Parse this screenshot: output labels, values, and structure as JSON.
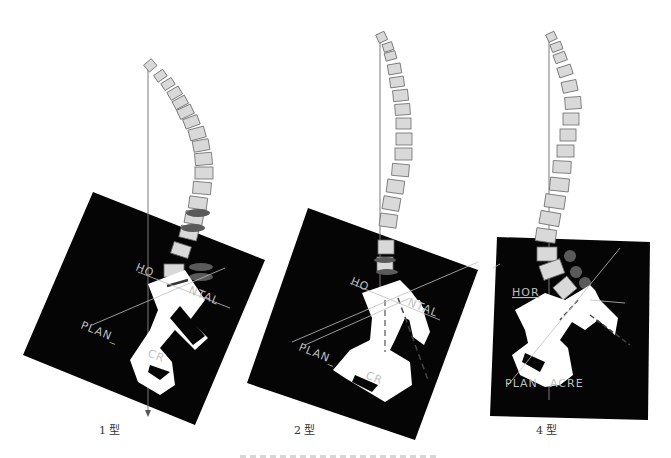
{
  "figure": {
    "panels": [
      {
        "id": "type-1",
        "label": "1 型",
        "horizontal_label": "HORIZONTAL",
        "plan_label": "PLAN_SACRE",
        "horizontal_visible": "HO",
        "horizontal_visible_tail": "NTAL",
        "plan_visible": "PLAN_",
        "plan_visible_tail": "CR"
      },
      {
        "id": "type-2",
        "label": "2 型",
        "horizontal_visible": "HO",
        "horizontal_visible_tail": "NTAL",
        "plan_visible": "PLAN_",
        "plan_visible_tail": "CR"
      },
      {
        "id": "type-4",
        "label": "4 型",
        "horizontal_visible": "HOR",
        "plan_visible": "PLAN",
        "plan_visible_tail": "ACRE"
      }
    ],
    "colors": {
      "background": "#ffffff",
      "panel_fill": "#050505",
      "vertebra_fill": "#d9d9d9",
      "vertebra_stroke": "#6b6b6b",
      "plumb_line": "#7a7a7a",
      "label_gray": "#bfbfbf",
      "lesion": "#5a5a5a"
    }
  }
}
